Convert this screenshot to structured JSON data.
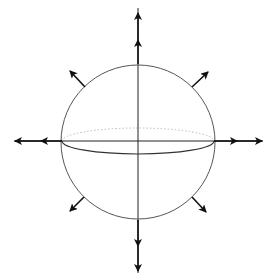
{
  "diagram": {
    "canvas": {
      "width": 274,
      "height": 280,
      "background": "#ffffff"
    },
    "colors": {
      "sphere_outline": "#555555",
      "equator_front": "#333333",
      "equator_back": "#bbbbbb",
      "axis": "#222222",
      "arrow": "#111111"
    },
    "sphere": {
      "cx": 138,
      "cy": 142,
      "r": 77
    },
    "equator": {
      "cx": 138,
      "cy": 141,
      "rx": 76,
      "ry": 13
    },
    "axes": {
      "vertical": {
        "x": 138,
        "y1": 8,
        "y2": 273
      },
      "horizontal": {
        "y": 141,
        "x1": 14,
        "x2": 263
      }
    },
    "arrows": [
      {
        "name": "up-inner",
        "x1": 138,
        "y1": 64,
        "x2": 138,
        "y2": 40
      },
      {
        "name": "up-outer",
        "x1": 138,
        "y1": 40,
        "x2": 138,
        "y2": 13
      },
      {
        "name": "down-inner",
        "x1": 138,
        "y1": 220,
        "x2": 138,
        "y2": 246
      },
      {
        "name": "down-outer",
        "x1": 138,
        "y1": 246,
        "x2": 138,
        "y2": 271
      },
      {
        "name": "left-inner",
        "x1": 62,
        "y1": 141,
        "x2": 41,
        "y2": 141
      },
      {
        "name": "left-outer",
        "x1": 41,
        "y1": 141,
        "x2": 15,
        "y2": 141
      },
      {
        "name": "right-inner",
        "x1": 214,
        "y1": 141,
        "x2": 237,
        "y2": 141
      },
      {
        "name": "right-outer",
        "x1": 237,
        "y1": 141,
        "x2": 262,
        "y2": 141
      },
      {
        "name": "upper-left",
        "x1": 85,
        "y1": 87,
        "x2": 70,
        "y2": 71
      },
      {
        "name": "upper-right",
        "x1": 192,
        "y1": 87,
        "x2": 208,
        "y2": 72
      },
      {
        "name": "lower-left",
        "x1": 84,
        "y1": 197,
        "x2": 70,
        "y2": 211
      },
      {
        "name": "lower-right",
        "x1": 192,
        "y1": 197,
        "x2": 206,
        "y2": 212
      }
    ]
  }
}
